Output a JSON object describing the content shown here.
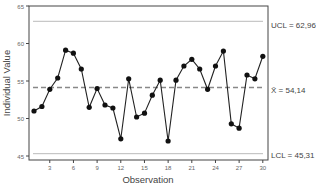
{
  "chart_data": {
    "type": "line",
    "title": "",
    "xlabel": "Observation",
    "ylabel": "Individual Value",
    "xlim": [
      0.5,
      30.5
    ],
    "ylim": [
      45,
      65
    ],
    "x_ticks": [
      3,
      6,
      9,
      12,
      15,
      18,
      21,
      24,
      27,
      30
    ],
    "y_ticks": [
      45,
      50,
      55,
      60,
      65
    ],
    "grid": false,
    "legend": "none",
    "x": [
      1,
      2,
      3,
      4,
      5,
      6,
      7,
      8,
      9,
      10,
      11,
      12,
      13,
      14,
      15,
      16,
      17,
      18,
      19,
      20,
      21,
      22,
      23,
      24,
      25,
      26,
      27,
      28,
      29,
      30
    ],
    "series": [
      {
        "name": "Individual Value",
        "values": [
          51.0,
          51.6,
          53.9,
          55.4,
          59.1,
          58.7,
          56.6,
          51.5,
          54.0,
          51.8,
          51.4,
          47.3,
          55.3,
          50.2,
          50.7,
          53.1,
          55.1,
          47.0,
          55.1,
          57.0,
          57.9,
          56.6,
          53.9,
          57.0,
          59.0,
          49.3,
          48.7,
          55.8,
          55.3,
          58.3
        ]
      }
    ],
    "control_lines": {
      "ucl": {
        "value": 62.96,
        "label": "UCL = 62,96"
      },
      "center": {
        "value": 54.14,
        "label": "X̄ = 54,14"
      },
      "lcl": {
        "value": 45.31,
        "label": "LCL = 45,31"
      }
    },
    "colors": {
      "line": "#222222",
      "marker": "#111111",
      "limit_line": "#bbbbbb",
      "center_line": "#888888",
      "axis": "#444444",
      "text": "#444444"
    }
  }
}
